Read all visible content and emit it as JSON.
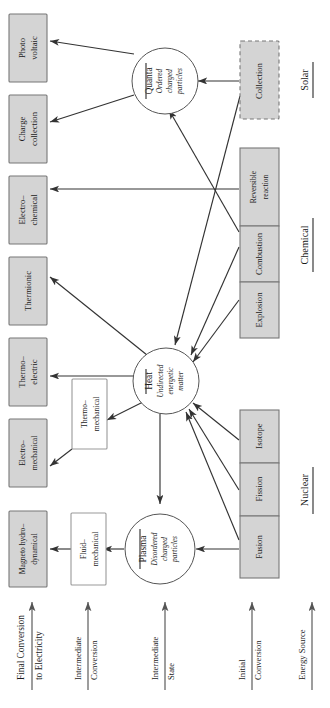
{
  "diagram": {
    "orientation": "rotated-90-ccw",
    "colors": {
      "source_box_fill": "#d4d4d4",
      "source_box_stroke": "#777777",
      "intermediate_box_fill": "#ffffff",
      "intermediate_box_stroke": "#9a9a9a",
      "edge": "#333333",
      "background": "#ffffff"
    }
  },
  "categories": [
    {
      "id": "solar",
      "label": "Solar"
    },
    {
      "id": "chemical",
      "label": "Chemical"
    },
    {
      "id": "nuclear",
      "label": "Nuclear"
    }
  ],
  "axis_labels": [
    {
      "id": "final-conversion",
      "line1": "Final Conversion",
      "line2": "to Electricity"
    },
    {
      "id": "intermediate-conversion",
      "line1": "Intermediate",
      "line2": "Conversion"
    },
    {
      "id": "intermediate-state",
      "line1": "Intermediate",
      "line2": "State"
    },
    {
      "id": "initial-conversion",
      "line1": "Initial",
      "line2": "Conversion"
    },
    {
      "id": "energy-source",
      "line1": "Energy Source",
      "line2": ""
    }
  ],
  "final_conversion_boxes": [
    {
      "id": "photo-voltaic",
      "line1": "Photo",
      "line2": "voltaic"
    },
    {
      "id": "charge-collection",
      "line1": "Charge",
      "line2": "collection"
    },
    {
      "id": "electro-chemical",
      "line1": "Electro–",
      "line2": "chemical"
    },
    {
      "id": "thermionic",
      "line1": "Thermionic",
      "line2": ""
    },
    {
      "id": "thermo-electric",
      "line1": "Thermo–",
      "line2": "electric"
    },
    {
      "id": "electro-mechanical",
      "line1": "Electro–",
      "line2": "mechanical"
    },
    {
      "id": "magneto-hydrodynamical",
      "line1": "Magneto hydro–",
      "line2": "dynamical"
    }
  ],
  "intermediate_conversion_boxes": [
    {
      "id": "thermo-mechanical",
      "line1": "Thermo–",
      "line2": "mechanical"
    },
    {
      "id": "fluid-mechanical",
      "line1": "Fluid–",
      "line2": "mechanical"
    }
  ],
  "intermediate_states": [
    {
      "id": "quanta",
      "title": "Quanta",
      "sub1": "Ordered",
      "sub2": "charged",
      "sub3": "particles"
    },
    {
      "id": "heat",
      "title": "Heat",
      "sub1": "Undirected",
      "sub2": "energetic",
      "sub3": "matter"
    },
    {
      "id": "plasma",
      "title": "Plasma",
      "sub1": "Disordered",
      "sub2": "charged",
      "sub3": "particles"
    }
  ],
  "initial_conversion_boxes": [
    {
      "id": "collection",
      "category": "solar",
      "line1": "Collection",
      "line2": "",
      "dashed": true
    },
    {
      "id": "reversible-reaction",
      "category": "chemical",
      "line1": "Reversible",
      "line2": "reaction",
      "dashed": false
    },
    {
      "id": "combustion",
      "category": "chemical",
      "line1": "Combustion",
      "line2": "",
      "dashed": false
    },
    {
      "id": "explosion",
      "category": "chemical",
      "line1": "Explosion",
      "line2": "",
      "dashed": false
    },
    {
      "id": "isotope",
      "category": "nuclear",
      "line1": "Isotope",
      "line2": "",
      "dashed": false
    },
    {
      "id": "fission",
      "category": "nuclear",
      "line1": "Fission",
      "line2": "",
      "dashed": false
    },
    {
      "id": "fusion",
      "category": "nuclear",
      "line1": "Fusion",
      "line2": "",
      "dashed": false
    }
  ],
  "edges": [
    {
      "from": "quanta",
      "to": "photo-voltaic"
    },
    {
      "from": "quanta",
      "to": "charge-collection"
    },
    {
      "from": "reversible-reaction",
      "to": "electro-chemical"
    },
    {
      "from": "collection",
      "to": "quanta"
    },
    {
      "from": "collection",
      "to": "heat"
    },
    {
      "from": "combustion",
      "to": "quanta"
    },
    {
      "from": "combustion",
      "to": "heat"
    },
    {
      "from": "explosion",
      "to": "heat"
    },
    {
      "from": "isotope",
      "to": "heat"
    },
    {
      "from": "fission",
      "to": "heat"
    },
    {
      "from": "fusion",
      "to": "heat"
    },
    {
      "from": "fusion",
      "to": "plasma"
    },
    {
      "from": "heat",
      "to": "thermionic"
    },
    {
      "from": "heat",
      "to": "thermo-electric"
    },
    {
      "from": "heat",
      "to": "thermo-mechanical"
    },
    {
      "from": "heat",
      "to": "plasma"
    },
    {
      "from": "thermo-mechanical",
      "to": "electro-mechanical"
    },
    {
      "from": "plasma",
      "to": "fluid-mechanical"
    },
    {
      "from": "fluid-mechanical",
      "to": "magneto-hydrodynamical"
    }
  ]
}
